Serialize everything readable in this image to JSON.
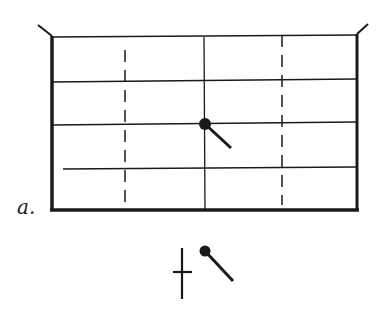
{
  "figure": {
    "panel_label": "a.",
    "colors": {
      "ink": "#1a1a1a",
      "background": "#ffffff"
    }
  },
  "legend": {
    "symbols": [
      "cross-marker",
      "pendulum-marker"
    ]
  }
}
